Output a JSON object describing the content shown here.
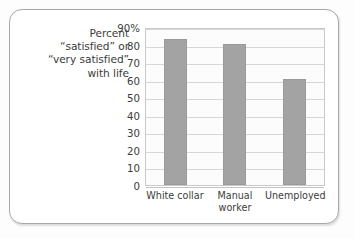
{
  "caption": {
    "lines": [
      "Percent",
      "“satisfied” or",
      "“very satisfied”",
      "with life"
    ]
  },
  "colors": {
    "bar": "#a3a3a3",
    "gridline": "#d7d7d7",
    "plot_border": "#c9c9c9",
    "card_border": "#a8a8a8",
    "text": "#3c3c3c",
    "plot_background": "#fcfcfc",
    "card_background": "#ffffff"
  },
  "chart_data": {
    "type": "bar",
    "title": "",
    "subtitle": "",
    "xlabel": "",
    "ylabel": "Percent “satisfied” or “very satisfied” with life",
    "categories": [
      "White collar",
      "Manual worker",
      "Unemployed"
    ],
    "category_lines": [
      [
        "White collar"
      ],
      [
        "Manual",
        "worker"
      ],
      [
        "Unemployed"
      ]
    ],
    "values": [
      83,
      80.5,
      60.5
    ],
    "ylim": [
      0,
      90
    ],
    "yticks": [
      90,
      80,
      70,
      60,
      50,
      40,
      30,
      20,
      10,
      0
    ],
    "ytick_labels": [
      "90%",
      "80",
      "70",
      "60",
      "50",
      "40",
      "30",
      "20",
      "10",
      "0"
    ],
    "grid": true,
    "grid_axis": "y",
    "legend": false,
    "legend_position": "none",
    "series": [
      {
        "name": "Percent satisfied or very satisfied with life",
        "values": [
          83,
          80.5,
          60.5
        ]
      }
    ]
  }
}
